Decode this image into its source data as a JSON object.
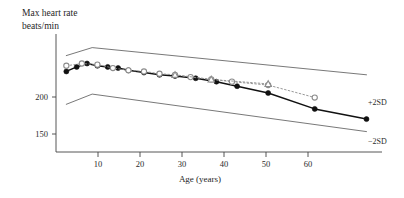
{
  "chart_data": {
    "type": "line",
    "title": "Max heart rate beats/min",
    "title_lines": [
      "Max heart rate",
      "beats/min"
    ],
    "xlabel": "Age (years)",
    "ylabel": "Max heart rate beats/min",
    "xlim": [
      3,
      66
    ],
    "ylim": [
      128,
      232
    ],
    "grid": false,
    "legend_position": "none",
    "xticks": [
      10,
      20,
      30,
      40,
      50,
      60
    ],
    "xtick_labels": [
      "10",
      "20",
      "30",
      "40",
      "50",
      "60"
    ],
    "yticks": [
      150,
      200
    ],
    "ytick_labels": [
      "150",
      "200"
    ],
    "annotations": [
      {
        "text": "+2SD",
        "x": 66,
        "y": 197
      },
      {
        "text": "−2SD",
        "x": 66,
        "y": 148
      }
    ],
    "series": [
      {
        "name": "+2SD",
        "style": "thin-solid",
        "marker": "none",
        "color": "#555555",
        "x": [
          5,
          10,
          63
        ],
        "values": [
          213,
          220,
          196
        ]
      },
      {
        "name": "−2SD",
        "style": "thin-solid",
        "marker": "none",
        "color": "#555555",
        "x": [
          5,
          10,
          63
        ],
        "values": [
          170,
          179,
          146
        ]
      },
      {
        "name": "Measured series A",
        "style": "solid",
        "marker": "filled-circle",
        "color": "#111111",
        "x": [
          5,
          7,
          9,
          11,
          13,
          15,
          17,
          20,
          23,
          26,
          30,
          34,
          38,
          44,
          53,
          63
        ],
        "values": [
          199,
          203,
          206,
          204,
          203,
          202,
          200,
          198,
          196,
          195,
          193,
          190,
          186,
          180,
          166,
          157
        ]
      },
      {
        "name": "Measured series B",
        "style": "dotted",
        "marker": "open-circle",
        "color": "#8c8c8c",
        "x": [
          5,
          8,
          11,
          14,
          17,
          20,
          23,
          26,
          29,
          33,
          37,
          44,
          53
        ],
        "values": [
          204,
          206,
          205,
          202,
          200,
          199,
          197,
          196,
          194,
          192,
          190,
          187,
          176
        ]
      },
      {
        "name": "Measured series C",
        "style": "dotted",
        "marker": "open-triangle",
        "color": "#8c8c8c",
        "x": [
          26,
          33,
          44
        ],
        "values": [
          196,
          192,
          188
        ]
      }
    ]
  }
}
